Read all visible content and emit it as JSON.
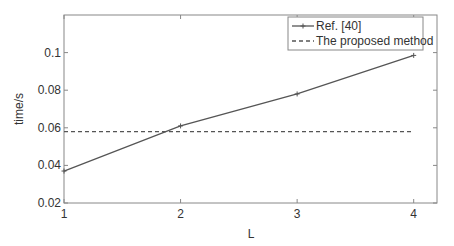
{
  "chart_data": {
    "type": "line",
    "title": "",
    "xlabel": "L",
    "ylabel": "time/s",
    "x": [
      1,
      2,
      3,
      4
    ],
    "xlim": [
      1,
      4.2
    ],
    "ylim": [
      0.02,
      0.12
    ],
    "xticks": [
      1,
      2,
      3,
      4
    ],
    "xtick_labels": [
      "1",
      "2",
      "3",
      "4"
    ],
    "yticks": [
      0.02,
      0.04,
      0.06,
      0.08,
      0.1
    ],
    "ytick_labels": [
      "0.02",
      "0.04",
      "0.06",
      "0.08",
      "0.1"
    ],
    "grid": false,
    "legend_position": "upper right",
    "series": [
      {
        "name": "Ref. [40]",
        "style": "solid",
        "marker": "plus",
        "color": "#555555",
        "values": [
          0.037,
          0.061,
          0.078,
          0.0985
        ]
      },
      {
        "name": "The proposed method",
        "style": "dashed",
        "marker": "none",
        "color": "#555555",
        "values": [
          0.058,
          0.058,
          0.058,
          0.058
        ]
      }
    ]
  },
  "colors": {
    "axis": "#888888",
    "text": "#333333",
    "line": "#555555"
  }
}
